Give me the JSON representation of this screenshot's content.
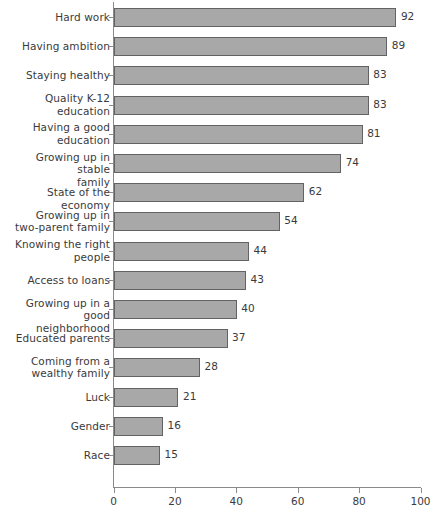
{
  "chart_data": {
    "type": "bar",
    "orientation": "horizontal",
    "title": "",
    "subtitle": "",
    "xlabel": "",
    "ylabel": "",
    "xlim": [
      0,
      100
    ],
    "xticks": [
      0,
      20,
      40,
      60,
      80,
      100
    ],
    "xtick_labels": [
      "0",
      "20",
      "40",
      "60",
      "80",
      "100"
    ],
    "grid": false,
    "legend": null,
    "bar_color": "#a8a8a8",
    "bar_border_color": "#636366",
    "axis_color": "#8a8a8c",
    "text_color": "#3a3a3c",
    "categories": [
      "Hard work",
      "Having ambition",
      "Staying healthy",
      "Quality K-12\neducation",
      "Having a good\neducation",
      "Growing up in stable\nfamily",
      "State of the economy",
      "Growing up in\ntwo-parent family",
      "Knowing the right\npeople",
      "Access to loans",
      "Growing up in a good\nneighborhood",
      "Educated parents",
      "Coming from a\nwealthy family",
      "Luck",
      "Gender",
      "Race"
    ],
    "values": [
      92,
      89,
      83,
      83,
      81,
      74,
      62,
      54,
      44,
      43,
      40,
      37,
      28,
      21,
      16,
      15
    ],
    "value_labels": [
      "92",
      "89",
      "83",
      "83",
      "81",
      "74",
      "62",
      "54",
      "44",
      "43",
      "40",
      "37",
      "28",
      "21",
      "16",
      "15"
    ]
  }
}
